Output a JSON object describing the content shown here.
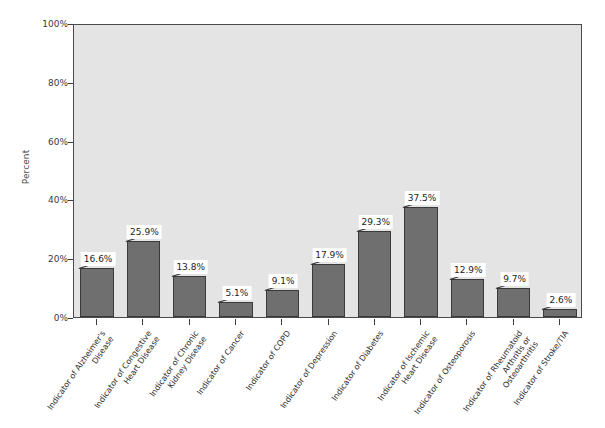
{
  "chart_data": {
    "type": "bar",
    "title": "",
    "subtitle": "",
    "xlabel": "",
    "ylabel": "Percent",
    "ylim": [
      0,
      100
    ],
    "yticks": [
      "0%",
      "20%",
      "40%",
      "60%",
      "80%",
      "100%"
    ],
    "ytick_values": [
      0,
      20,
      40,
      60,
      80,
      100
    ],
    "grid": false,
    "legend": "none",
    "value_suffix": "%",
    "categories": [
      "Indicator of Alzheimer's Disease",
      "Indicator of Congestive Heart Disease",
      "Indicator of Chronic Kidney Disease",
      "Indicator of Cancer",
      "Indicator of COPD",
      "Indicator of Depression",
      "Indicator of Diabetes",
      "Indicator of Ischemic Heart Disease",
      "Indicator of Osteoporosis",
      "Indicator of Rheumatoid Arthritis or Osteoarthritis",
      "Indicator of Stroke/TIA"
    ],
    "category_lines": [
      [
        "Indicator of Alzheimer's",
        "Disease"
      ],
      [
        "Indicator of Congestive",
        "Heart Disease"
      ],
      [
        "Indicator of Chronic",
        "Kidney Disease"
      ],
      [
        "Indicator of Cancer"
      ],
      [
        "Indicator of COPD"
      ],
      [
        "Indicator of Depression"
      ],
      [
        "Indicator of Diabetes"
      ],
      [
        "Indicator of Ischemic",
        "Heart Disease"
      ],
      [
        "Indicator of Osteoporosis"
      ],
      [
        "Indicator of Rheumatoid",
        "Arthritis or",
        "Osteoarthritis"
      ],
      [
        "Indicator of Stroke/TIA"
      ]
    ],
    "values": [
      16.6,
      25.9,
      13.8,
      5.1,
      9.1,
      17.9,
      29.3,
      37.5,
      12.9,
      9.7,
      2.6
    ],
    "value_labels": [
      "16.6%",
      "25.9%",
      "13.8%",
      "5.1%",
      "9.1%",
      "17.9%",
      "29.3%",
      "37.5%",
      "12.9%",
      "9.7%",
      "2.6%"
    ],
    "colors": {
      "bar_fill": "#6f6f6f",
      "bar_border": "#3a3a3a",
      "plot_background": "#e4e4e4",
      "axis": "#4a4a4a",
      "label_box": "#ffffff",
      "text": "#2e2e2e",
      "page_background": "#ffffff"
    }
  }
}
